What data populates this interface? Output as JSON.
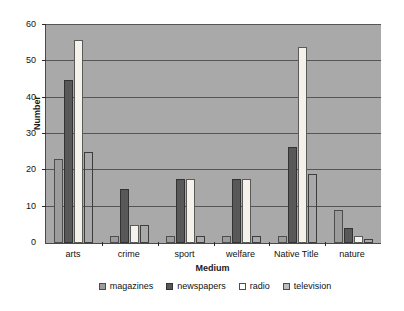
{
  "chart_data": {
    "type": "bar",
    "title": "",
    "xlabel": "Medium",
    "ylabel": "Number",
    "ylim": [
      0,
      60
    ],
    "yticks": [
      0,
      10,
      20,
      30,
      40,
      50,
      60
    ],
    "ytick_labels": [
      "0",
      "10",
      "20",
      "30",
      "40",
      "50",
      "60"
    ],
    "grid": true,
    "legend_position": "bottom",
    "plot_background": "#a9a9a9",
    "categories": [
      "arts",
      "crime",
      "sport",
      "welfare",
      "Native Title",
      "nature"
    ],
    "series": [
      {
        "name": "magazines",
        "color": "#9c9c9c",
        "values": [
          23,
          2,
          2,
          2,
          2,
          9
        ]
      },
      {
        "name": "newspapers",
        "color": "#585858",
        "values": [
          45,
          15,
          17.5,
          17.5,
          26.5,
          4
        ]
      },
      {
        "name": "radio",
        "color": "#f4f2ea",
        "values": [
          56,
          5,
          17.5,
          17.5,
          54,
          2
        ]
      },
      {
        "name": "television",
        "color": "#bdbdbd",
        "values": [
          25,
          5,
          2,
          2,
          19,
          1
        ]
      }
    ]
  },
  "legend": {
    "items": [
      {
        "label": "magazines"
      },
      {
        "label": "newspapers"
      },
      {
        "label": "radio"
      },
      {
        "label": "television"
      }
    ]
  }
}
